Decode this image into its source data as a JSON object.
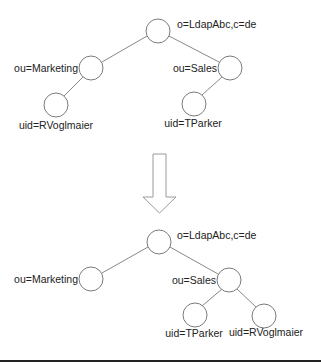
{
  "diagram": {
    "title": "",
    "before": {
      "nodes": [
        {
          "id": "root",
          "label": "o=LdapAbc,c=de",
          "cx": 158,
          "cy": 31
        },
        {
          "id": "marketing",
          "label": "ou=Marketing",
          "cx": 91,
          "cy": 68
        },
        {
          "id": "sales",
          "label": "ou=Sales",
          "cx": 230,
          "cy": 68
        },
        {
          "id": "rvoglmaier",
          "label": "uid=RVoglmaier",
          "cx": 56,
          "cy": 105
        },
        {
          "id": "tparker",
          "label": "uid=TParker",
          "cx": 194,
          "cy": 104
        }
      ],
      "edges": [
        [
          "root",
          "marketing"
        ],
        [
          "root",
          "sales"
        ],
        [
          "marketing",
          "rvoglmaier"
        ],
        [
          "sales",
          "tparker"
        ]
      ]
    },
    "transition": {
      "icon": "down-arrow-icon"
    },
    "after": {
      "nodes": [
        {
          "id": "root",
          "label": "o=LdapAbc,c=de",
          "cx": 159,
          "cy": 242
        },
        {
          "id": "marketing",
          "label": "ou=Marketing",
          "cx": 91,
          "cy": 279
        },
        {
          "id": "sales",
          "label": "ou=Sales",
          "cx": 229,
          "cy": 280
        },
        {
          "id": "tparker",
          "label": "uid=TParker",
          "cx": 195,
          "cy": 315
        },
        {
          "id": "rvoglmaier",
          "label": "uid=RVoglmaier",
          "cx": 264,
          "cy": 316
        }
      ],
      "edges": [
        [
          "root",
          "marketing"
        ],
        [
          "root",
          "sales"
        ],
        [
          "sales",
          "tparker"
        ],
        [
          "sales",
          "rvoglmaier"
        ]
      ]
    }
  }
}
